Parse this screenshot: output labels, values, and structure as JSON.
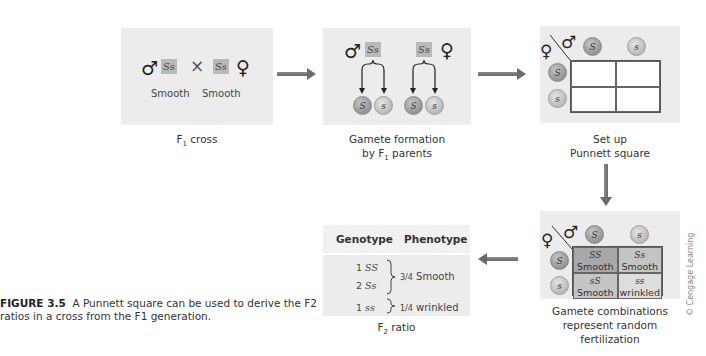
{
  "figure": {
    "number": "FIGURE 3.5",
    "caption": "A Punnett square can be used to derive the F2 ratios in a cross from the F1 generation.",
    "credit": "© Cengage Learning"
  },
  "colors": {
    "panel_bg": "#ececec",
    "genotype_box": "#b9b9b9",
    "arrow": "#6a6a6a",
    "cell_SS": "#a8a8a8",
    "cell_Ss": "#c4c4c4",
    "cell_sS": "#c4c4c4",
    "cell_ss": "#dddddd"
  },
  "symbols": {
    "male": "♂",
    "female": "♀",
    "cross": "×"
  },
  "step1": {
    "label_main": "F",
    "label_sub": "1",
    "label_rest": " cross",
    "male_genotype": "Ss",
    "female_genotype": "Ss",
    "male_phenotype": "Smooth",
    "female_phenotype": "Smooth"
  },
  "step2": {
    "label_line1": "Gamete formation",
    "label_line2_pre": "by F",
    "label_line2_sub": "1",
    "label_line2_post": " parents",
    "male_genotype": "Ss",
    "female_genotype": "Ss",
    "gametes": [
      "S",
      "s",
      "S",
      "s"
    ]
  },
  "step3": {
    "label_line1": "Set up",
    "label_line2": "Punnett square",
    "male_gametes": [
      "S",
      "s"
    ],
    "female_gametes": [
      "S",
      "s"
    ]
  },
  "step4": {
    "label_line1": "Gamete combinations",
    "label_line2": "represent random",
    "label_line3": "fertilization",
    "male_gametes": [
      "S",
      "s"
    ],
    "female_gametes": [
      "S",
      "s"
    ],
    "cells": [
      {
        "genotype": "SS",
        "phenotype": "Smooth"
      },
      {
        "genotype": "Ss",
        "phenotype": "Smooth"
      },
      {
        "genotype": "sS",
        "phenotype": "Smooth"
      },
      {
        "genotype": "ss",
        "phenotype": "wrinkled"
      }
    ]
  },
  "step5": {
    "label_main": "F",
    "label_sub": "2",
    "label_rest": " ratio",
    "header_genotype": "Genotype",
    "header_phenotype": "Phenotype",
    "rows": [
      {
        "count": "1",
        "genotype": "SS"
      },
      {
        "count": "2",
        "genotype": "Ss"
      },
      {
        "count": "1",
        "genotype": "ss"
      }
    ],
    "phenotype_smooth_frac": "3/4",
    "phenotype_smooth": "Smooth",
    "phenotype_wrinkled_frac": "1/4",
    "phenotype_wrinkled": "wrinkled"
  }
}
